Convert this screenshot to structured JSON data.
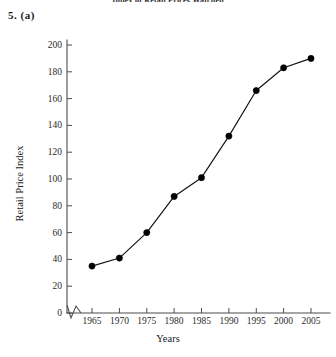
{
  "page": {
    "running_header": "Index of Retail Prices Watched",
    "question_label": "5. (a)"
  },
  "axis_titles": {
    "x": "Years",
    "y": "Retail Price Index"
  },
  "y_ticks": [
    "0",
    "20",
    "40",
    "60",
    "80",
    "100",
    "120",
    "140",
    "160",
    "180",
    "200"
  ],
  "x_ticks": [
    "1965",
    "1970",
    "1975",
    "1980",
    "1985",
    "1990",
    "1995",
    "2000",
    "2005"
  ],
  "marks": {
    "axis_break": "axis-break-zigzag"
  },
  "colors": {
    "line": "#111111",
    "marker": "#000000",
    "axis": "#4d4d4d",
    "background": "#ffffff",
    "text": "#222222"
  },
  "chart_data": {
    "type": "line",
    "title": "",
    "xlabel": "Years",
    "ylabel": "Retail Price Index",
    "x": [
      1965,
      1970,
      1975,
      1980,
      1985,
      1990,
      1995,
      2000,
      2005
    ],
    "categories": [
      "1965",
      "1970",
      "1975",
      "1980",
      "1985",
      "1990",
      "1995",
      "2000",
      "2005"
    ],
    "values": [
      35,
      41,
      60,
      87,
      101,
      132,
      166,
      183,
      190
    ],
    "series": [
      {
        "name": "Retail Price Index",
        "values": [
          35,
          41,
          60,
          87,
          101,
          132,
          166,
          183,
          190
        ]
      }
    ],
    "xlim": [
      1965,
      2005
    ],
    "ylim": [
      0,
      200
    ],
    "ytick_step": 20,
    "xtick_step": 5,
    "grid": false,
    "legend": false,
    "markers": "filled-circle",
    "axis_break_x": true
  }
}
